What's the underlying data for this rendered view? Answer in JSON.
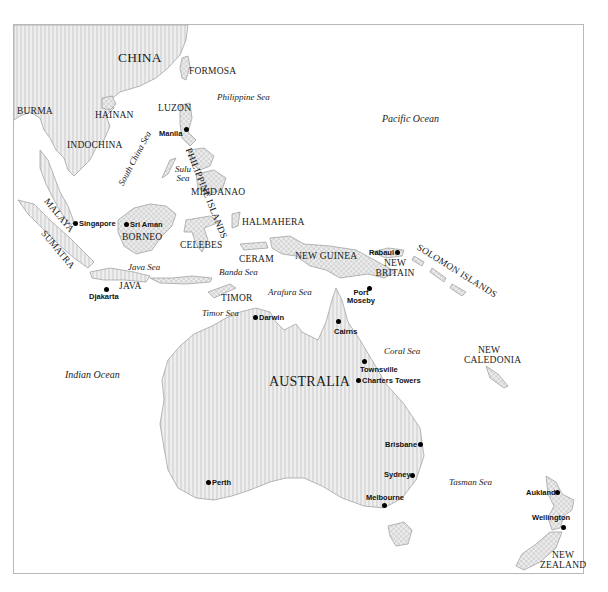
{
  "map": {
    "countries": {
      "china": "CHINA",
      "burma": "BURMA",
      "hainan": "HAINAN",
      "indochina": "INDOCHINA",
      "formosa": "FORMOSA",
      "luzon": "LUZON",
      "philippine_islands": "PHILIPPINE ISLANDS",
      "mindanao": "MINDANAO",
      "malaya": "MALAYA",
      "sumatra": "SUMATRA",
      "borneo": "BORNEO",
      "celebes": "CELEBES",
      "halmahera": "HALMAHERA",
      "ceram": "CERAM",
      "java": "JAVA",
      "timor": "TIMOR",
      "new_guinea": "NEW GUINEA",
      "new_britain_1": "NEW",
      "new_britain_2": "BRITAIN",
      "solomon_islands": "SOLOMON ISLANDS",
      "new_caledonia_1": "NEW",
      "new_caledonia_2": "CALEDONIA",
      "australia": "AUSTRALIA",
      "new_zealand_1": "NEW",
      "new_zealand_2": "ZEALAND"
    },
    "seas": {
      "philippine_sea": "Philippine Sea",
      "pacific_ocean": "Pacific Ocean",
      "south_china_sea": "South China Sea",
      "sulu_sea_1": "Sulu",
      "sulu_sea_2": "Sea",
      "java_sea": "Java Sea",
      "banda_sea": "Banda Sea",
      "arafura_sea": "Arafura Sea",
      "timor_sea": "Timor Sea",
      "coral_sea": "Coral Sea",
      "indian_ocean": "Indian Ocean",
      "tasman_sea": "Tasman Sea"
    },
    "cities": {
      "manila": "Manila",
      "singapore": "Singapore",
      "sri_aman": "Sri Aman",
      "djakarta": "Djakarta",
      "rabaul": "Rabaul",
      "port_moseby_1": "Port",
      "port_moseby_2": "Moseby",
      "darwin": "Darwin",
      "cairns": "Cairns",
      "townsville": "Townsville",
      "charters_towers": "Charters Towers",
      "brisbane": "Brisbane",
      "sydney": "Sydney",
      "perth": "Perth",
      "melbourne": "Melbourne",
      "aukland": "Aukland",
      "wellington": "Wellington"
    },
    "colors": {
      "land_fill": "#e6e6e6",
      "land_stroke": "#9a9a9a",
      "frame": "#b8b8b8",
      "city_dot": "#000000"
    }
  }
}
